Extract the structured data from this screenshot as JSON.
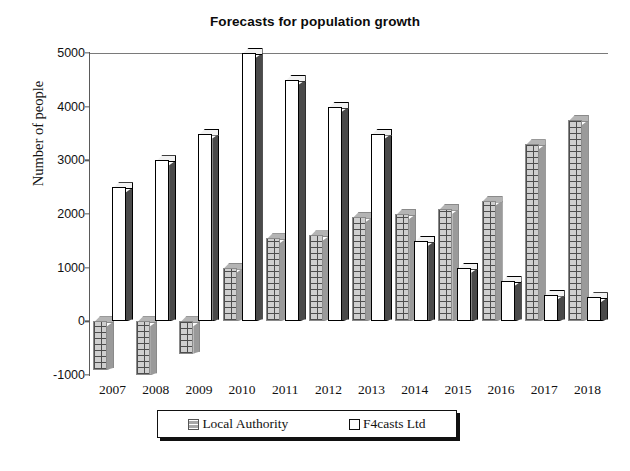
{
  "chart_data": {
    "type": "bar",
    "title": "Forecasts for population growth",
    "xlabel": "",
    "ylabel": "Number of people",
    "categories": [
      "2007",
      "2008",
      "2009",
      "2010",
      "2011",
      "2012",
      "2013",
      "2014",
      "2015",
      "2016",
      "2017",
      "2018"
    ],
    "yticks": [
      5000,
      4000,
      3000,
      2000,
      1000,
      0,
      -1000
    ],
    "ytick_labels": [
      "5000",
      "4000",
      "3000",
      "2000",
      "1000",
      "0",
      "-1000"
    ],
    "ylim": [
      -1000,
      5000
    ],
    "grid": false,
    "legend_position": "bottom",
    "series": [
      {
        "name": "Local Authority",
        "color": "#b4b4b4",
        "values": [
          -900,
          -1000,
          -600,
          1000,
          1550,
          1600,
          1950,
          2000,
          2100,
          2250,
          3300,
          3750
        ]
      },
      {
        "name": "F4casts Ltd",
        "color": "#ffffff",
        "values": [
          2500,
          3000,
          3500,
          5000,
          4500,
          4000,
          3500,
          1500,
          1000,
          750,
          500,
          450
        ]
      }
    ]
  },
  "legend": {
    "items": [
      {
        "label": "Local Authority",
        "swatch": "patterned-grey-square-icon"
      },
      {
        "label": "F4casts Ltd",
        "swatch": "white-outlined-square-icon"
      }
    ]
  }
}
